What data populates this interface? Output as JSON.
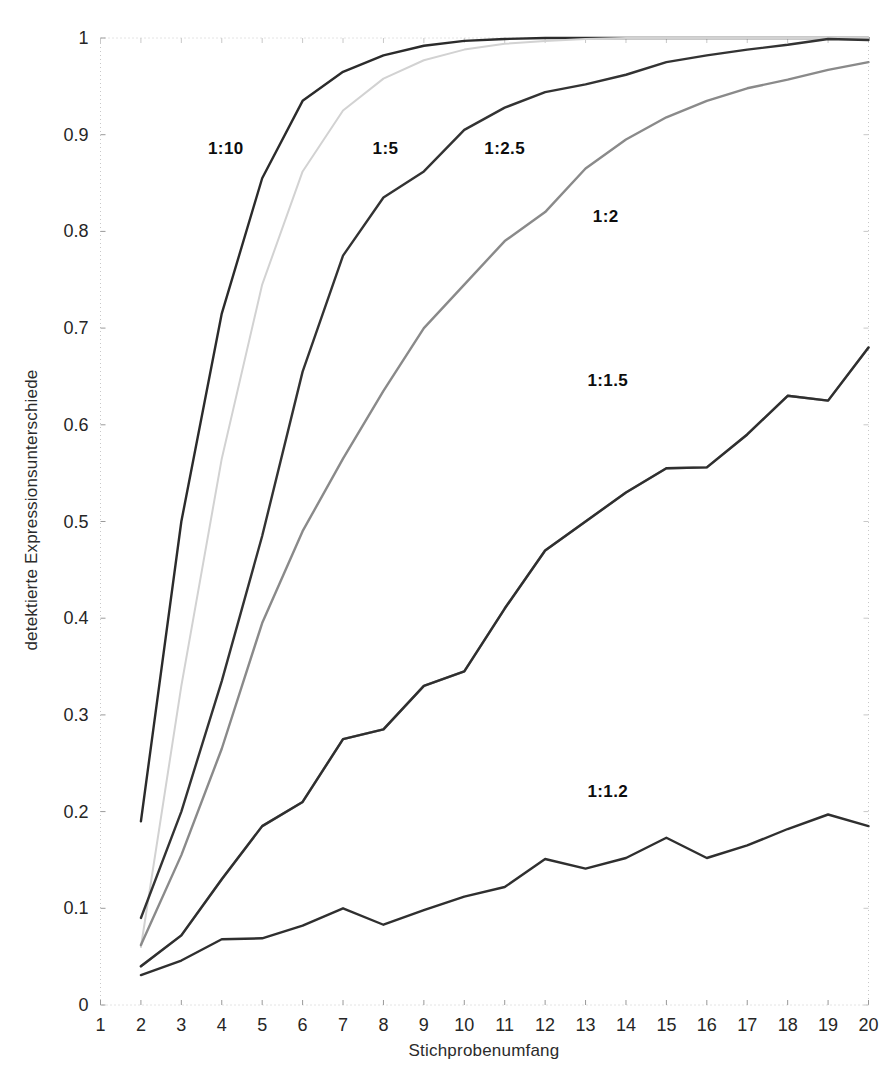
{
  "chart_data": {
    "type": "line",
    "title": "",
    "xlabel": "Stichprobenumfang",
    "ylabel": "detektierte Expressionsunterschiede",
    "xlim": [
      1,
      20
    ],
    "ylim": [
      0,
      1
    ],
    "grid": false,
    "legend_position": "inline-annotations",
    "xticks": [
      "1",
      "2",
      "3",
      "4",
      "5",
      "6",
      "7",
      "8",
      "9",
      "10",
      "11",
      "12",
      "13",
      "14",
      "15",
      "16",
      "17",
      "18",
      "19",
      "20"
    ],
    "yticks": [
      "0",
      "0.1",
      "0.2",
      "0.3",
      "0.4",
      "0.5",
      "0.6",
      "0.7",
      "0.8",
      "0.9",
      "1"
    ],
    "x": [
      2,
      3,
      4,
      5,
      6,
      7,
      8,
      9,
      10,
      11,
      12,
      13,
      14,
      15,
      16,
      17,
      18,
      19,
      20
    ],
    "series": [
      {
        "name": "1:10",
        "color": "#2b2b2b",
        "label_x": 4.1,
        "label_y": 0.885,
        "values": [
          0.19,
          0.5,
          0.715,
          0.855,
          0.935,
          0.965,
          0.982,
          0.992,
          0.997,
          0.999,
          1.0,
          1.0,
          1.0,
          1.0,
          1.0,
          1.0,
          1.0,
          1.0,
          1.0
        ]
      },
      {
        "name": "unlabeled-light",
        "color": "#d2d2d2",
        "label_x": null,
        "label_y": null,
        "values": [
          0.06,
          0.33,
          0.565,
          0.745,
          0.862,
          0.925,
          0.958,
          0.977,
          0.988,
          0.994,
          0.997,
          0.999,
          1.0,
          1.0,
          1.0,
          1.0,
          1.0,
          1.0,
          1.0
        ]
      },
      {
        "name": "1:5",
        "color": "#333333",
        "label_x": 8.05,
        "label_y": 0.885,
        "values": [
          0.09,
          0.2,
          0.335,
          0.485,
          0.655,
          0.775,
          0.835,
          0.862,
          0.905,
          0.928,
          0.944,
          0.952,
          0.962,
          0.975,
          0.982,
          0.988,
          0.993,
          0.999,
          0.998
        ]
      },
      {
        "name": "1:2.5",
        "color": "#8a8a8a",
        "label_x": 11.0,
        "label_y": 0.885,
        "values": [
          0.062,
          0.155,
          0.265,
          0.395,
          0.49,
          0.565,
          0.635,
          0.7,
          0.745,
          0.79,
          0.82,
          0.865,
          0.895,
          0.918,
          0.935,
          0.948,
          0.957,
          0.967,
          0.975
        ]
      },
      {
        "name": "1:2",
        "color": "#909090",
        "label_x": 13.5,
        "label_y": 0.815,
        "values": [
          0.04,
          0.072,
          0.13,
          0.185,
          0.21,
          0.275,
          0.285,
          0.33,
          0.345,
          0.41,
          0.47,
          0.5,
          0.53,
          0.555,
          0.556,
          0.59,
          0.63,
          0.625,
          0.68
        ]
      },
      {
        "name": "1:1.5",
        "color": "#2f2f2f",
        "label_x": 13.55,
        "label_y": 0.645,
        "values": [
          0.04,
          0.072,
          0.13,
          0.185,
          0.21,
          0.275,
          0.285,
          0.33,
          0.345,
          0.41,
          0.47,
          0.5,
          0.53,
          0.555,
          0.556,
          0.59,
          0.63,
          0.625,
          0.68
        ]
      },
      {
        "name": "1:1.2",
        "color": "#2f2f2f",
        "label_x": 13.55,
        "label_y": 0.22,
        "values": [
          0.031,
          0.046,
          0.068,
          0.069,
          0.082,
          0.1,
          0.083,
          0.098,
          0.112,
          0.122,
          0.151,
          0.141,
          0.152,
          0.173,
          0.152,
          0.165,
          0.182,
          0.197,
          0.185
        ]
      }
    ]
  },
  "axis": {
    "x_title": "Stichprobenumfang",
    "y_title": "detektierte Expressionsunterschiede"
  }
}
